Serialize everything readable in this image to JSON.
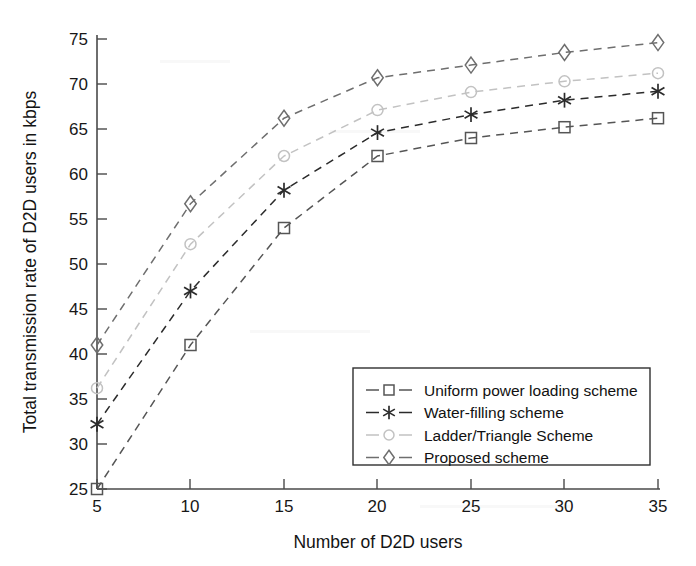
{
  "chart_data": {
    "type": "line",
    "title": "",
    "xlabel": "Number of D2D users",
    "ylabel": "Total transmission rate of D2D users in kbps",
    "x": [
      5,
      10,
      15,
      20,
      25,
      30,
      35
    ],
    "xlim": [
      5,
      35
    ],
    "ylim": [
      25,
      75
    ],
    "xticks": [
      "5",
      "10",
      "15",
      "20",
      "25",
      "30",
      "35"
    ],
    "yticks": [
      "25",
      "30",
      "35",
      "40",
      "45",
      "50",
      "55",
      "60",
      "65",
      "70",
      "75"
    ],
    "grid": false,
    "legend_position": "lower right",
    "series": [
      {
        "name": "Uniform power loading scheme",
        "marker": "square",
        "color": "#555555",
        "linestyle": "dashed",
        "values": [
          25.0,
          41.0,
          54.0,
          62.0,
          64.0,
          65.2,
          66.2
        ]
      },
      {
        "name": "Water-filling scheme",
        "marker": "asterisk",
        "color": "#2b2b2b",
        "linestyle": "dashed",
        "values": [
          32.2,
          47.0,
          58.2,
          64.6,
          66.6,
          68.2,
          69.2
        ]
      },
      {
        "name": "Ladder/Triangle Scheme",
        "marker": "circle",
        "color": "#c2c2c2",
        "linestyle": "dashed",
        "values": [
          36.2,
          52.2,
          62.0,
          67.1,
          69.1,
          70.3,
          71.2
        ]
      },
      {
        "name": "Proposed scheme",
        "marker": "diamond",
        "color": "#6e6e6e",
        "linestyle": "dashed",
        "values": [
          41.0,
          56.7,
          66.2,
          70.7,
          72.1,
          73.5,
          74.6
        ]
      }
    ]
  },
  "legend": {
    "entries": [
      {
        "label": "Uniform power loading scheme"
      },
      {
        "label": "Water-filling scheme"
      },
      {
        "label": "Ladder/Triangle Scheme"
      },
      {
        "label": "Proposed scheme"
      }
    ]
  },
  "axes": {
    "x_title": "Number of D2D users",
    "y_title": "Total transmission rate of D2D users in kbps"
  }
}
